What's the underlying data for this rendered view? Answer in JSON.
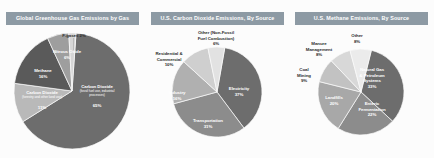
{
  "charts": [
    {
      "title": "Global Greenhouse Gas Emissions by Gas",
      "chart_data": {
        "type": "pie",
        "title": "Global Greenhouse Gas Emissions by Gas",
        "xlabel": "",
        "ylabel": "",
        "legend_position": "none",
        "grid": false,
        "categories": [
          "Carbon Dioxide (fossil fuel use, industrial processes)",
          "Carbon Dioxide (forestry and other land use)",
          "Methane",
          "Nitrous Oxide",
          "F-gases"
        ],
        "values": [
          65,
          11,
          16,
          6,
          2
        ],
        "labels": [
          "65%",
          "11%",
          "16%",
          "6%",
          "2%"
        ],
        "colors": [
          "#6d6d6d",
          "#b9b9b9",
          "#5a5a5a",
          "#9e9e9e",
          "#d6d6d6"
        ]
      },
      "slices": [
        {
          "name": "Carbon Dioxide (fossil fuel use, industrial processes) 65%",
          "title": "Carbon Dioxide",
          "sub": "(fossil fuel use, industrial processes)",
          "pct": "65%",
          "value": 65,
          "color": "#6d6d6d",
          "placement": "inside"
        },
        {
          "name": "Carbon Dioxide (forestry and other land use) 11%",
          "title": "Carbon Dioxide",
          "sub": "(forestry and other land use)",
          "pct": "11%",
          "value": 11,
          "color": "#b9b9b9",
          "placement": "inside"
        },
        {
          "name": "Methane 16%",
          "title": "Methane",
          "sub": "",
          "pct": "16%",
          "value": 16,
          "color": "#5a5a5a",
          "placement": "inside"
        },
        {
          "name": "Nitrous Oxide 6%",
          "title": "Nitrous Oxide",
          "sub": "",
          "pct": "6%",
          "value": 6,
          "color": "#9e9e9e",
          "placement": "inside"
        },
        {
          "name": "F-gases 2%",
          "title": "F-gases 2%",
          "sub": "",
          "pct": "",
          "value": 2,
          "color": "#d6d6d6",
          "placement": "outside"
        }
      ]
    },
    {
      "title": "U.S. Carbon Dioxide Emissions, By Source",
      "chart_data": {
        "type": "pie",
        "title": "U.S. Carbon Dioxide Emissions, By Source",
        "xlabel": "",
        "ylabel": "",
        "legend_position": "none",
        "grid": false,
        "categories": [
          "Electricity",
          "Transportation",
          "Industry",
          "Residential & Commercial",
          "Other (Non-Fossil Fuel Combustion)"
        ],
        "values": [
          37,
          31,
          16,
          10,
          6
        ],
        "labels": [
          "37%",
          "31%",
          "16%",
          "10%",
          "6%"
        ],
        "colors": [
          "#6d6d6d",
          "#8c8c8c",
          "#b0b0b0",
          "#cfcfcf",
          "#e2e2e2"
        ]
      },
      "slices": [
        {
          "name": "Electricity 37%",
          "title": "Electricity",
          "sub": "",
          "pct": "37%",
          "value": 37,
          "color": "#6d6d6d",
          "placement": "inside"
        },
        {
          "name": "Transportation 31%",
          "title": "Transportation",
          "sub": "",
          "pct": "31%",
          "value": 31,
          "color": "#8c8c8c",
          "placement": "inside"
        },
        {
          "name": "Industry 16%",
          "title": "Industry",
          "sub": "",
          "pct": "16%",
          "value": 16,
          "color": "#b0b0b0",
          "placement": "inside"
        },
        {
          "name": "Residential & Commercial 10%",
          "title": "Residential &\nCommercial",
          "sub": "",
          "pct": "10%",
          "value": 10,
          "color": "#cfcfcf",
          "placement": "outside"
        },
        {
          "name": "Other (Non-Fossil Fuel Combustion) 6%",
          "title": "Other (Non-Fossil\nFuel Combustion)",
          "sub": "",
          "pct": "6%",
          "value": 6,
          "color": "#e2e2e2",
          "placement": "outside"
        }
      ]
    },
    {
      "title": "U.S. Methane Emissions, By Source",
      "chart_data": {
        "type": "pie",
        "title": "U.S. Methane Emissions, By Source",
        "xlabel": "",
        "ylabel": "",
        "legend_position": "none",
        "grid": false,
        "categories": [
          "Natural Gas & Petroleum Systems",
          "Enteric Fermentation",
          "Landfills",
          "Coal Mining",
          "Manure Management",
          "Other"
        ],
        "values": [
          33,
          22,
          20,
          9,
          8,
          8
        ],
        "labels": [
          "33%",
          "22%",
          "20%",
          "9%",
          "8%",
          "8%"
        ],
        "colors": [
          "#6d6d6d",
          "#8c8c8c",
          "#a8a8a8",
          "#c2c2c2",
          "#d8d8d8",
          "#ebebeb"
        ]
      },
      "slices": [
        {
          "name": "Natural Gas & Petroleum Systems 33%",
          "title": "Natural Gas\n& Petroleum\nSystems",
          "sub": "",
          "pct": "33%",
          "value": 33,
          "color": "#6d6d6d",
          "placement": "inside"
        },
        {
          "name": "Enteric Fermentation 22%",
          "title": "Enteric\nFermentation",
          "sub": "",
          "pct": "22%",
          "value": 22,
          "color": "#8c8c8c",
          "placement": "inside"
        },
        {
          "name": "Landfills 20%",
          "title": "Landfills",
          "sub": "",
          "pct": "20%",
          "value": 20,
          "color": "#a8a8a8",
          "placement": "inside"
        },
        {
          "name": "Coal Mining 9%",
          "title": "Coal\nMining",
          "sub": "",
          "pct": "9%",
          "value": 9,
          "color": "#c2c2c2",
          "placement": "outside"
        },
        {
          "name": "Manure Management 8%",
          "title": "Manure\nManagement",
          "sub": "",
          "pct": "8%",
          "value": 8,
          "color": "#d8d8d8",
          "placement": "outside"
        },
        {
          "name": "Other 8%",
          "title": "Other",
          "sub": "",
          "pct": "8%",
          "value": 8,
          "color": "#ebebeb",
          "placement": "outside"
        }
      ]
    }
  ]
}
